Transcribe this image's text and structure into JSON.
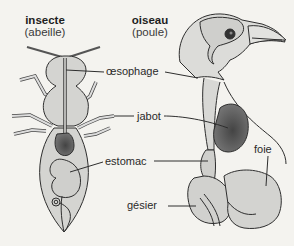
{
  "titles": {
    "insect": {
      "name": "insecte",
      "example": "(abeille)"
    },
    "bird": {
      "name": "oiseau",
      "example": "(poule)"
    }
  },
  "labels": {
    "oesophagus": "œsophage",
    "crop": "jabot",
    "stomach": "estomac",
    "liver": "foie",
    "gizzard": "gésier"
  },
  "colors": {
    "background": "#f4f3ef",
    "organ_light": "#d2d2cf",
    "organ_dark": "#555555",
    "outline": "#2e2e2e"
  }
}
